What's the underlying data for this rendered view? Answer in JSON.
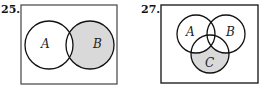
{
  "diagrams": [
    {
      "number": "25.",
      "sets": [
        "A",
        "B"
      ],
      "shaded_region": "B minus A",
      "shade_color": "#d9d9d9"
    },
    {
      "number": "27.",
      "sets": [
        "A",
        "B",
        "C"
      ],
      "shaded_region": "C minus (A union B)",
      "shade_color": "#d9d9d9"
    }
  ]
}
